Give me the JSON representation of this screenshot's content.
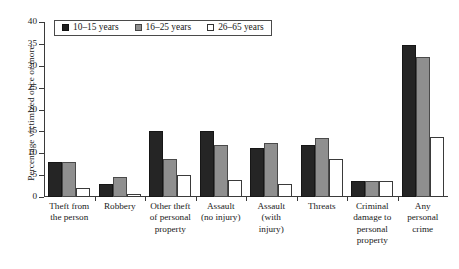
{
  "chart_data": {
    "type": "bar",
    "title": "",
    "xlabel": "",
    "ylabel": "Percentage victimized once or more",
    "ylim": [
      0,
      40
    ],
    "yticks": [
      0,
      5,
      10,
      15,
      20,
      25,
      30,
      35,
      40
    ],
    "grid": false,
    "legend_position": "top-left",
    "categories": [
      "Theft from the person",
      "Robbery",
      "Other theft of personal property",
      "Assault (no injury)",
      "Assault (with injury)",
      "Threats",
      "Criminal damage to personal property",
      "Any personal crime"
    ],
    "category_lines": [
      [
        "Theft from",
        "the person"
      ],
      [
        "Robbery"
      ],
      [
        "Other theft",
        "of personal",
        "property"
      ],
      [
        "Assault",
        "(no injury)"
      ],
      [
        "Assault",
        "(with",
        "injury)"
      ],
      [
        "Threats"
      ],
      [
        "Criminal",
        "damage to",
        "personal",
        "property"
      ],
      [
        "Any",
        "personal",
        "crime"
      ]
    ],
    "series": [
      {
        "name": "10–15 years",
        "color": "#252525",
        "values": [
          8.0,
          3.0,
          15.0,
          15.0,
          11.3,
          12.0,
          3.7,
          34.7
        ]
      },
      {
        "name": "16–25 years",
        "color": "#8f8f8f",
        "values": [
          8.0,
          4.5,
          8.7,
          12.0,
          12.3,
          13.5,
          3.7,
          32.0
        ]
      },
      {
        "name": "26–65 years",
        "color": "#ffffff",
        "values": [
          2.0,
          0.8,
          5.0,
          3.8,
          3.0,
          8.7,
          3.7,
          13.7
        ]
      }
    ]
  },
  "legend": {
    "items": [
      {
        "label": "10–15 years"
      },
      {
        "label": "16–25 years"
      },
      {
        "label": "26–65 years"
      }
    ]
  },
  "axes": {
    "y_title": "Percentage victimized once or more"
  }
}
